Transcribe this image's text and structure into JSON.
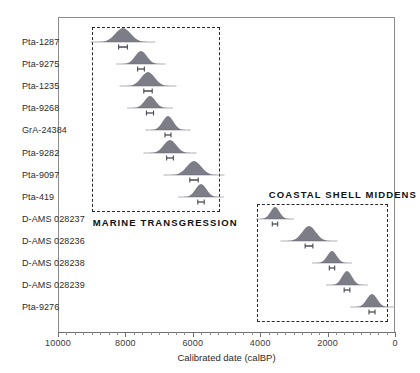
{
  "chart_data": {
    "type": "scatter",
    "title": "",
    "xlabel": "Calibrated date (calBP)",
    "ylabel": "",
    "xlim": [
      10000,
      0
    ],
    "x_axis_reversed": true,
    "grid": false,
    "legend": false,
    "xticks": [
      10000,
      8000,
      6000,
      4000,
      2000,
      0
    ],
    "xtick_labels": [
      "10000",
      "8000",
      "6000",
      "4000",
      "2000",
      "0"
    ],
    "minor_tick_interval": 250,
    "marker_style": "probability-density-hill-with-error-bar",
    "categories": [
      "Pta-1287",
      "Pta-9275",
      "Pta-1235",
      "Pta-9268",
      "GrA-24384",
      "Pta-9282",
      "Pta-9097",
      "Pta-419",
      "D-AMS 028237",
      "D-AMS 028236",
      "D-AMS 028238",
      "D-AMS 028239",
      "Pta-9276"
    ],
    "points": [
      {
        "label": "Pta-1287",
        "x": 8070,
        "error": 260,
        "width": 34,
        "height": 14,
        "group": "marine-transgression"
      },
      {
        "label": "Pta-9275",
        "x": 7530,
        "error": 200,
        "width": 26,
        "height": 13,
        "group": "marine-transgression"
      },
      {
        "label": "Pta-1235",
        "x": 7340,
        "error": 250,
        "width": 30,
        "height": 14,
        "group": "marine-transgression"
      },
      {
        "label": "Pta-9268",
        "x": 7280,
        "error": 210,
        "width": 24,
        "height": 12,
        "group": "marine-transgression"
      },
      {
        "label": "GrA-24384",
        "x": 6740,
        "error": 180,
        "width": 24,
        "height": 14,
        "group": "marine-transgression"
      },
      {
        "label": "Pta-9282",
        "x": 6670,
        "error": 200,
        "width": 28,
        "height": 13,
        "group": "marine-transgression"
      },
      {
        "label": "Pta-9097",
        "x": 5960,
        "error": 250,
        "width": 32,
        "height": 14,
        "group": "marine-transgression"
      },
      {
        "label": "Pta-419",
        "x": 5750,
        "error": 190,
        "width": 24,
        "height": 13,
        "group": "marine-transgression"
      },
      {
        "label": "D-AMS 028237",
        "x": 3570,
        "error": 160,
        "width": 20,
        "height": 12,
        "group": "coastal-shell-middens"
      },
      {
        "label": "D-AMS 028236",
        "x": 2560,
        "error": 230,
        "width": 30,
        "height": 15,
        "group": "coastal-shell-middens"
      },
      {
        "label": "D-AMS 028238",
        "x": 1880,
        "error": 160,
        "width": 21,
        "height": 12,
        "group": "coastal-shell-middens"
      },
      {
        "label": "D-AMS 028239",
        "x": 1420,
        "error": 170,
        "width": 22,
        "height": 14,
        "group": "coastal-shell-middens"
      },
      {
        "label": "Pta-9276",
        "x": 680,
        "error": 180,
        "width": 23,
        "height": 13,
        "group": "coastal-shell-middens"
      }
    ],
    "groups": [
      {
        "id": "marine-transgression",
        "title": "MARINE TRANSGRESSION",
        "title_position": "below-box-left",
        "x_range": [
          9000,
          5200
        ],
        "row_range": [
          1,
          8
        ]
      },
      {
        "id": "coastal-shell-middens",
        "title": "COASTAL SHELL MIDDENS",
        "title_position": "above-box",
        "x_range": [
          4100,
          210
        ],
        "row_range": [
          9,
          13
        ]
      }
    ],
    "marker_color": "#6b6b78",
    "axis_color": "#8c8c8c",
    "box_color": "#2a2a2a"
  }
}
